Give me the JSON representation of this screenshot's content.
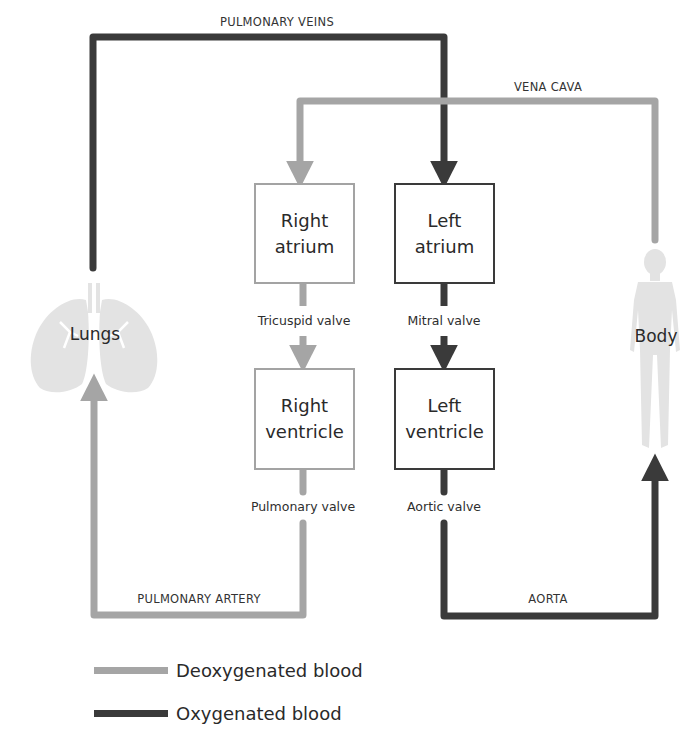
{
  "vessels": {
    "pulmonary_veins": "PULMONARY VEINS",
    "vena_cava": "VENA CAVA",
    "pulmonary_artery": "PULMONARY ARTERY",
    "aorta": "AORTA"
  },
  "chambers": {
    "right_atrium": "Right\natrium",
    "left_atrium": "Left\natrium",
    "right_ventricle": "Right\nventricle",
    "left_ventricle": "Left\nventricle"
  },
  "valves": {
    "tricuspid": "Tricuspid valve",
    "mitral": "Mitral valve",
    "pulmonary": "Pulmonary valve",
    "aortic": "Aortic valve"
  },
  "organs": {
    "lungs": "Lungs",
    "body": "Body"
  },
  "legend": {
    "items": [
      {
        "label": "Deoxygenated blood",
        "color": "#a5a5a5"
      },
      {
        "label": "Oxygenated blood",
        "color": "#3a3a3a"
      }
    ]
  },
  "colors": {
    "deoxygenated": "#a5a5a5",
    "oxygenated": "#3a3a3a",
    "organ_fill": "#e3e3e3"
  }
}
